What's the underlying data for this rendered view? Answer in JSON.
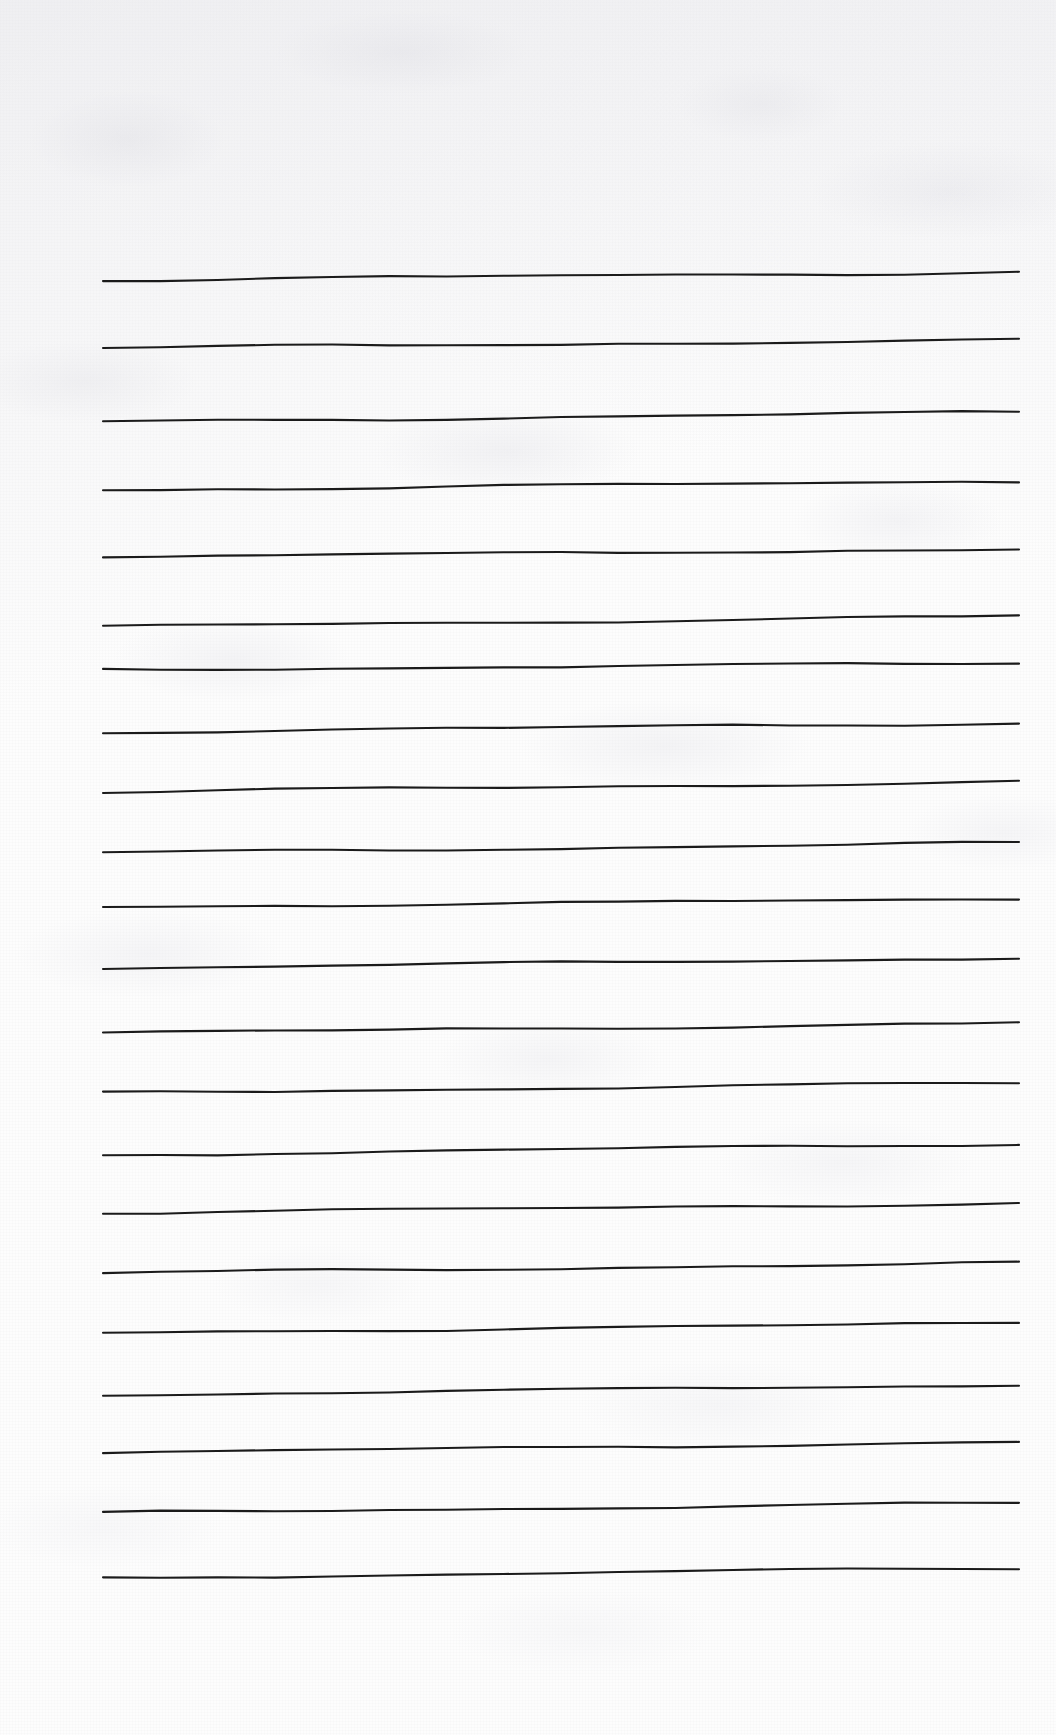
{
  "document": {
    "kind": "lined-notepaper-scan",
    "title": "Blank ruled notepaper",
    "orientation": "portrait",
    "width_px": 1056,
    "height_px": 1735,
    "paper_color": "#fdfdfd",
    "rule_color": "#1b1b1b",
    "rule_stroke_width_px": 2.1,
    "rule_count": 21,
    "content_text": "",
    "has_margin_rule": false,
    "has_header": false,
    "has_footer": false,
    "notes": "No text, headings, numbers or marks are written on the page; only the horizontal ruling lines are visible."
  },
  "ruling": {
    "left_x": 103,
    "right_x": 1019,
    "first_line_y": 280,
    "last_line_y": 1578,
    "lines": [
      {
        "index": 1,
        "y_left": 280,
        "y_right": 272
      },
      {
        "index": 2,
        "y_left": 348,
        "y_right": 340
      },
      {
        "index": 3,
        "y_left": 422,
        "y_right": 412
      },
      {
        "index": 4,
        "y_left": 490,
        "y_right": 481
      },
      {
        "index": 5,
        "y_left": 557,
        "y_right": 549
      },
      {
        "index": 6,
        "y_left": 627,
        "y_right": 616
      },
      {
        "index": 7,
        "y_left": 670,
        "y_right": 663
      },
      {
        "index": 8,
        "y_left": 732,
        "y_right": 723
      },
      {
        "index": 9,
        "y_left": 792,
        "y_right": 782
      },
      {
        "index": 10,
        "y_left": 853,
        "y_right": 843
      },
      {
        "index": 11,
        "y_left": 907,
        "y_right": 899
      },
      {
        "index": 12,
        "y_left": 968,
        "y_right": 958
      },
      {
        "index": 13,
        "y_left": 1033,
        "y_right": 1023
      },
      {
        "index": 14,
        "y_left": 1093,
        "y_right": 1083
      },
      {
        "index": 15,
        "y_left": 1155,
        "y_right": 1144
      },
      {
        "index": 16,
        "y_left": 1213,
        "y_right": 1203
      },
      {
        "index": 17,
        "y_left": 1273,
        "y_right": 1263
      },
      {
        "index": 18,
        "y_left": 1333,
        "y_right": 1323
      },
      {
        "index": 19,
        "y_left": 1395,
        "y_right": 1385
      },
      {
        "index": 20,
        "y_left": 1453,
        "y_right": 1442
      },
      {
        "index": 21,
        "y_left": 1513,
        "y_right": 1503
      },
      {
        "index": 22,
        "y_left": 1578,
        "y_right": 1568
      }
    ]
  },
  "margins": {
    "top_blank_px": 280,
    "bottom_blank_px": 157,
    "left_blank_px": 103,
    "right_blank_px": 37
  }
}
